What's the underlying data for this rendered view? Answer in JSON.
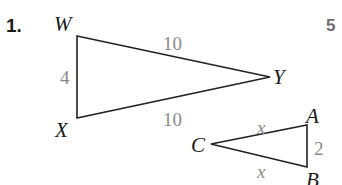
{
  "problem": {
    "number_label": "1.",
    "score_label": "5"
  },
  "triangle_wxy": {
    "vertices": {
      "W": "W",
      "X": "X",
      "Y": "Y"
    },
    "sides": {
      "WX": "4",
      "WY": "10",
      "XY": "10"
    }
  },
  "triangle_cab": {
    "vertices": {
      "C": "C",
      "A": "A",
      "B": "B"
    },
    "sides": {
      "CA": "x",
      "CB": "x",
      "AB": "2"
    }
  },
  "colors": {
    "stroke": "#222222",
    "side_label": "#8a8a8a",
    "score": "#6d6d6d"
  }
}
